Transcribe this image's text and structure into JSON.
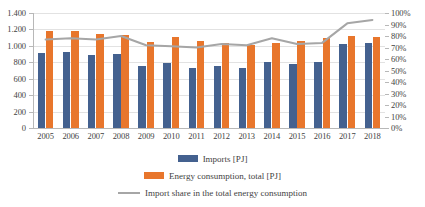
{
  "chart_data": {
    "type": "bar",
    "title": "",
    "subtitle": "",
    "xlabel": "",
    "ylabel": "",
    "categories": [
      "2005",
      "2006",
      "2007",
      "2008",
      "2009",
      "2010",
      "2011",
      "2012",
      "2013",
      "2014",
      "2015",
      "2016",
      "2017",
      "2018"
    ],
    "series": [
      {
        "name": "Imports [PJ]",
        "type": "bar",
        "axis": "left",
        "color": "#44618f",
        "values": [
          915,
          920,
          890,
          900,
          755,
          790,
          735,
          760,
          730,
          805,
          775,
          805,
          1020,
          1040
        ]
      },
      {
        "name": "Energy consumption, total [PJ]",
        "type": "bar",
        "axis": "left",
        "color": "#e8762c",
        "values": [
          1180,
          1175,
          1150,
          1130,
          1045,
          1110,
          1055,
          1035,
          1010,
          1035,
          1065,
          1095,
          1115,
          1110
        ]
      },
      {
        "name": "Import share in the total energy consumption",
        "type": "line",
        "axis": "right",
        "color": "#a6a6a6",
        "values": [
          77,
          78,
          77,
          80,
          72,
          71,
          70,
          73,
          72,
          78,
          73,
          74,
          91,
          94
        ]
      }
    ],
    "left_axis": {
      "min": 0,
      "max": 1400,
      "step": 200,
      "ticks": [
        "0",
        "200",
        "400",
        "600",
        "800",
        "1.000",
        "1.200",
        "1.400"
      ]
    },
    "right_axis": {
      "min": 0,
      "max": 100,
      "step": 10,
      "ticks": [
        "0%",
        "10%",
        "20%",
        "30%",
        "40%",
        "50%",
        "60%",
        "70%",
        "80%",
        "90%",
        "100%"
      ]
    },
    "grid": true,
    "legend_position": "bottom"
  },
  "legend": {
    "items": [
      {
        "label": "Imports [PJ]",
        "marker": "bar-swatch-blue"
      },
      {
        "label": "Energy consumption, total [PJ]",
        "marker": "bar-swatch-orange"
      },
      {
        "label": "Import share in the total energy consumption",
        "marker": "line-swatch-gray"
      }
    ]
  }
}
